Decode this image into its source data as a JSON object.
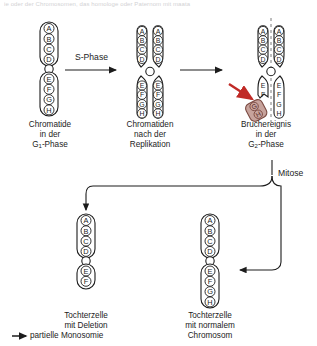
{
  "page": {
    "cut_header_text": "ie oder der Chromosomen, das homologe oder Paternom mit maata",
    "background_color": "#ffffff",
    "ink_color": "#1c1c1c",
    "fragment_color": "#9d6258",
    "fragment_fill": "#c7a39c",
    "break_arrow_color": "#c02a26"
  },
  "stage1": {
    "name": "chromatide-g1",
    "arm_upper": [
      "A",
      "B",
      "C",
      "D"
    ],
    "arm_lower": [
      "E",
      "F",
      "G",
      "H"
    ],
    "caption_lines": [
      "Chromatide",
      "in der",
      "G1-Phase"
    ],
    "caption_line3_pre": "G",
    "caption_line3_sub": "1",
    "caption_line3_post": "-Phase"
  },
  "transition1": {
    "name": "s-phase-arrow",
    "label": "S-Phase"
  },
  "stage2": {
    "name": "chromatiden-nach-replikation",
    "left_chromatid": {
      "arm_upper": [
        "A",
        "B",
        "C",
        "D"
      ],
      "arm_lower": [
        "E",
        "F",
        "G",
        "H"
      ]
    },
    "right_chromatid": {
      "arm_upper": [
        "A",
        "B",
        "C",
        "D"
      ],
      "arm_lower": [
        "E",
        "F",
        "G",
        "H"
      ]
    },
    "caption_lines": [
      "Chromatiden",
      "nach der",
      "Replikation"
    ]
  },
  "transition2": {
    "name": "plain-arrow",
    "label": ""
  },
  "stage3": {
    "name": "bruchereignis-g2",
    "left_chromatid": {
      "arm_upper": [
        "A",
        "B",
        "C",
        "D"
      ],
      "arm_lower": [
        "E",
        "F"
      ]
    },
    "right_chromatid": {
      "arm_upper": [
        "A",
        "B",
        "C",
        "D"
      ],
      "arm_lower": [
        "E",
        "F",
        "G",
        "H"
      ]
    },
    "fragment": {
      "name": "broken-fragment",
      "letters": [
        "G",
        "H"
      ]
    },
    "caption_lines": [
      "Bruchereignis",
      "in der",
      "G2-Phase"
    ],
    "caption_line3_pre": "G",
    "caption_line3_sub": "2",
    "caption_line3_post": "-Phase"
  },
  "mitosis": {
    "name": "mitose-branch",
    "label": "Mitose"
  },
  "daughter_left": {
    "name": "tochterzelle-deletion",
    "arm_upper": [
      "A",
      "B",
      "C",
      "D"
    ],
    "arm_lower": [
      "E",
      "F"
    ],
    "caption_lines": [
      "Tochterzelle",
      "mit Deletion"
    ],
    "note_arrow": "➤",
    "note": "partielle Monosomie"
  },
  "daughter_right": {
    "name": "tochterzelle-normal",
    "arm_upper": [
      "A",
      "B",
      "C",
      "D"
    ],
    "arm_lower": [
      "E",
      "F",
      "G",
      "H"
    ],
    "caption_lines": [
      "Tochterzelle",
      "mit normalem",
      "Chromosom"
    ]
  }
}
